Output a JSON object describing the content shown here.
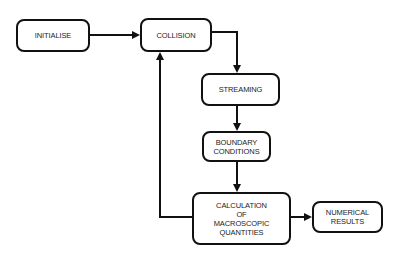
{
  "diagram": {
    "type": "flowchart",
    "nodes": {
      "initialise": "INITIALISE",
      "collision": "COLLISION",
      "streaming": "STREAMING",
      "boundary": "BOUNDARY\nCONDITIONS",
      "calculation": "CALCULATION\nOF\nMACROSCOPIC\nQUANTITIES",
      "results": "NUMERICAL\nRESULTS"
    },
    "edges": [
      {
        "from": "INITIALISE",
        "to": "COLLISION"
      },
      {
        "from": "COLLISION",
        "to": "STREAMING"
      },
      {
        "from": "STREAMING",
        "to": "BOUNDARY CONDITIONS"
      },
      {
        "from": "BOUNDARY CONDITIONS",
        "to": "CALCULATION OF MACROSCOPIC QUANTITIES"
      },
      {
        "from": "CALCULATION OF MACROSCOPIC QUANTITIES",
        "to": "NUMERICAL RESULTS"
      },
      {
        "from": "CALCULATION OF MACROSCOPIC QUANTITIES",
        "to": "COLLISION",
        "kind": "feedback-loop"
      }
    ],
    "colors": {
      "stroke": "#111111",
      "background": "#ffffff",
      "text": "#222222"
    }
  }
}
